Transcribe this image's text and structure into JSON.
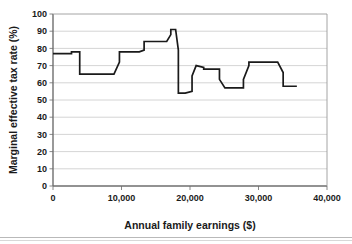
{
  "chart_data": {
    "type": "line",
    "title": "",
    "xlabel": "Annual family earnings ($)",
    "ylabel": "Marginal effective tax rate (%)",
    "xlim": [
      0,
      40000
    ],
    "ylim": [
      0,
      100
    ],
    "grid": "horizontal",
    "legend": "none",
    "xticks": [
      0,
      10000,
      20000,
      30000,
      40000
    ],
    "xtick_labels": [
      "0",
      "10,000",
      "20,000",
      "30,000",
      "40,000"
    ],
    "yticks": [
      0,
      10,
      20,
      30,
      40,
      50,
      60,
      70,
      80,
      90,
      100
    ],
    "ytick_labels": [
      "0",
      "10",
      "20",
      "30",
      "40",
      "50",
      "60",
      "70",
      "80",
      "90",
      "100"
    ],
    "line_color": "#1a1a1a",
    "series": [
      {
        "name": "Marginal effective tax rate",
        "x": [
          0,
          2700,
          2700,
          3400,
          3400,
          3900,
          3900,
          8900,
          8900,
          9700,
          9700,
          12600,
          12600,
          13300,
          13300,
          14100,
          14100,
          16600,
          16600,
          17200,
          17200,
          17900,
          17900,
          18300,
          18300,
          19300,
          19300,
          20300,
          20300,
          20900,
          20900,
          22000,
          22000,
          22900,
          22900,
          24300,
          24300,
          25100,
          25100,
          25900,
          25900,
          27800,
          27800,
          28600,
          28600,
          29400,
          29400,
          32800,
          32800,
          33600,
          33600,
          35600
        ],
        "y": [
          77,
          77,
          78,
          78,
          78,
          78,
          65,
          65,
          65,
          72,
          78,
          78,
          78,
          79,
          84,
          84,
          84,
          84,
          84,
          88,
          91,
          91,
          91,
          79,
          54,
          54,
          54,
          55,
          64,
          70,
          70,
          69,
          68,
          68,
          68,
          68,
          62,
          57,
          57,
          57,
          57,
          57,
          62,
          70,
          72,
          72,
          72,
          72,
          72,
          66,
          58,
          58
        ]
      }
    ]
  }
}
